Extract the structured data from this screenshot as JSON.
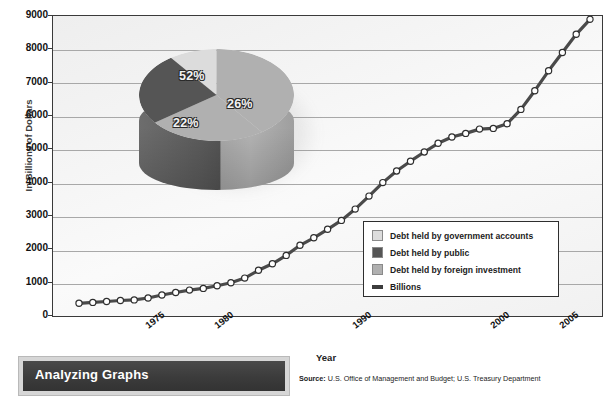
{
  "title": "Gross Federal Debt grew rapidly over the years and has not yet paid back.",
  "analyzing_box": {
    "title": "Analyzing Graphs"
  },
  "source": {
    "prefix": "Source:",
    "text": " U.S. Office of Management and Budget; U.S. Treasury Department"
  },
  "legend": {
    "items": [
      {
        "label": "Debt held by government accounts",
        "swatch": "legend-swatch-light",
        "color": "#dcdcdc",
        "type": "box"
      },
      {
        "label": "Debt held by public",
        "swatch": "legend-swatch-dark",
        "color": "#555555",
        "type": "box"
      },
      {
        "label": "Debt held by foreign investment",
        "swatch": "legend-swatch-medium",
        "color": "#b0b0b0",
        "type": "box"
      },
      {
        "label": "Billions",
        "swatch": "legend-swatch-line",
        "color": "#3c3c3c",
        "type": "line"
      }
    ]
  },
  "chart_data": [
    {
      "type": "line",
      "title": "Gross Federal Debt grew rapidly over the years and has not yet paid back.",
      "xlabel": "Year",
      "ylabel": "In Billions of Dollars",
      "ylim": [
        0,
        9000
      ],
      "yticks": [
        0,
        1000,
        2000,
        3000,
        4000,
        5000,
        6000,
        7000,
        8000,
        9000
      ],
      "xlim": [
        1970,
        2007
      ],
      "xticks": [
        1975,
        1980,
        1990,
        2000,
        2005
      ],
      "xtick_labels": [
        "1975",
        "1980",
        "1990",
        "2000",
        "2005"
      ],
      "grid": true,
      "legend_position": "inside-bottom-right",
      "series": [
        {
          "name": "Billions",
          "color": "#4a4a4a",
          "marker": "circle-open-white",
          "x": [
            1970,
            1971,
            1972,
            1973,
            1974,
            1975,
            1976,
            1977,
            1978,
            1979,
            1980,
            1981,
            1982,
            1983,
            1984,
            1985,
            1986,
            1987,
            1988,
            1989,
            1990,
            1991,
            1992,
            1993,
            1994,
            1995,
            1996,
            1997,
            1998,
            1999,
            2000,
            2001,
            2002,
            2003,
            2004,
            2005,
            2006,
            2007
          ],
          "values": [
            381,
            408,
            436,
            466,
            484,
            541,
            629,
            706,
            777,
            829,
            909,
            995,
            1137,
            1372,
            1565,
            1818,
            2120,
            2346,
            2601,
            2868,
            3206,
            3598,
            4002,
            4351,
            4643,
            4921,
            5181,
            5369,
            5478,
            5606,
            5629,
            5770,
            6198,
            6760,
            7355,
            7905,
            8451,
            8900
          ]
        }
      ]
    },
    {
      "type": "pie",
      "title": "",
      "style": "3d",
      "labels": [
        "Debt held by government accounts",
        "Debt held by foreign investment",
        "Debt held by public"
      ],
      "values": [
        52,
        26,
        22
      ],
      "value_labels": [
        "52%",
        "26%",
        "22%"
      ],
      "colors": [
        "#dcdcdc",
        "#b0b0b0",
        "#555555"
      ]
    }
  ]
}
